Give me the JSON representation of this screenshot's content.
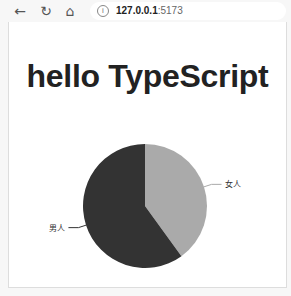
{
  "browser": {
    "back_icon": "←",
    "reload_icon": "↻",
    "home_icon": "⌂",
    "info_icon": "i",
    "url_host": "127.0.0.1",
    "url_port": ":5173"
  },
  "page": {
    "title": "hello TypeScript"
  },
  "chart_data": {
    "type": "pie",
    "title": "",
    "categories": [
      "女人",
      "男人"
    ],
    "values": [
      40,
      60
    ],
    "colors": [
      "#aaaaaa",
      "#333333"
    ],
    "labels": [
      {
        "text": "女人",
        "side": "right"
      },
      {
        "text": "男人",
        "side": "left"
      }
    ],
    "legend": "none"
  }
}
